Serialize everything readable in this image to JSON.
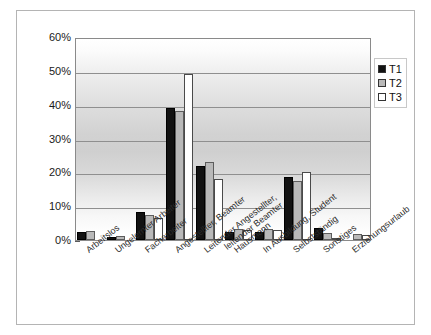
{
  "chart_data": {
    "type": "bar",
    "title": "",
    "xlabel": "",
    "ylabel": "",
    "ylim": [
      0,
      60
    ],
    "ytick_labels": [
      "0%",
      "10%",
      "20%",
      "30%",
      "40%",
      "50%",
      "60%"
    ],
    "ytick_values": [
      0,
      10,
      20,
      30,
      40,
      50,
      60
    ],
    "grid": true,
    "legend_position": "top-right",
    "categories": [
      "Arbeitslos",
      "Ungelernter Arbeiter",
      "Facharbeiter",
      "Angestellter, Beamter",
      "Leitender Angestellter,\nleitender Beamter",
      "Hausmann",
      "In Ausbildung, Student",
      "Selbstständig",
      "Sonstiges",
      "Erziehungsurlaub"
    ],
    "series": [
      {
        "name": "T1",
        "color": "#121212",
        "values": [
          2.3,
          1.0,
          8.2,
          39.0,
          22.0,
          2.4,
          2.5,
          18.5,
          3.5,
          0.0
        ]
      },
      {
        "name": "T2",
        "color": "#b9b9b9",
        "values": [
          2.6,
          1.2,
          7.5,
          38.0,
          23.0,
          3.2,
          3.3,
          17.5,
          2.0,
          1.8
        ]
      },
      {
        "name": "T3",
        "color": "#ffffff",
        "values": [
          0.0,
          0.0,
          6.6,
          49.0,
          18.0,
          2.9,
          3.0,
          20.0,
          0.6,
          1.5
        ]
      }
    ]
  },
  "legend": {
    "items": [
      {
        "label": "T1",
        "swatch": "black"
      },
      {
        "label": "T2",
        "swatch": "gray"
      },
      {
        "label": "T3",
        "swatch": "white"
      }
    ]
  }
}
